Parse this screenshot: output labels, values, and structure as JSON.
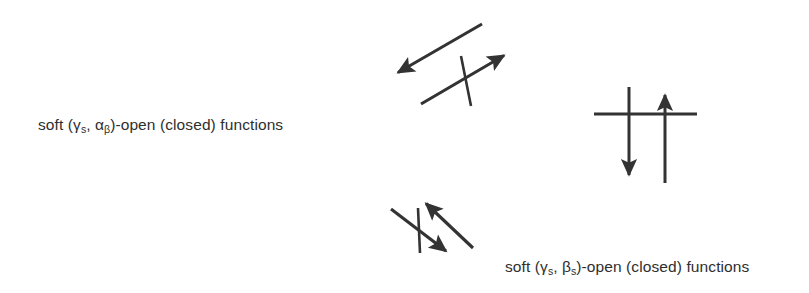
{
  "figure": {
    "width": 809,
    "height": 293,
    "background_color": "#ffffff",
    "ink_color": "#333333"
  },
  "labels": {
    "alpha_label": {
      "prefix": "soft (",
      "gamma": "γ",
      "gamma_sub": "s",
      "separator": ", ",
      "second_symbol": "α",
      "second_sub": "β",
      "suffix": ")-open (closed) functions",
      "full_text": "soft (γs, αβ)-open (closed) functions"
    },
    "beta_label": {
      "prefix": "soft (",
      "gamma": "γ",
      "gamma_sub": "s",
      "separator": ", ",
      "second_symbol": "β",
      "second_sub": "s",
      "suffix": ")-open (closed) functions",
      "full_text": "soft (γs, βs)-open (closed) functions"
    }
  },
  "diagram": {
    "type": "implication-diagram",
    "groups": [
      {
        "name": "upper-left-diagonal-pair",
        "orientation": "diagonal-up-right",
        "arrows": [
          {
            "name": "arrow-up-left",
            "x1": 482,
            "y1": 24,
            "x2": 392,
            "y2": 76,
            "head_at": "end",
            "direction": "up-left"
          },
          {
            "name": "arrow-up-right",
            "x1": 421,
            "y1": 104,
            "x2": 510,
            "y2": 51,
            "head_at": "end",
            "direction": "up-right"
          }
        ],
        "negation_stroke": {
          "x1": 461,
          "y1": 56,
          "x2": 471,
          "y2": 106
        }
      },
      {
        "name": "right-vertical-pair",
        "orientation": "vertical",
        "arrows": [
          {
            "name": "arrow-down",
            "x1": 629,
            "y1": 87,
            "x2": 629,
            "y2": 182,
            "head_at": "end",
            "direction": "down"
          },
          {
            "name": "arrow-up",
            "x1": 665,
            "y1": 183,
            "x2": 665,
            "y2": 87,
            "head_at": "end",
            "direction": "up"
          }
        ],
        "negation_stroke": {
          "x1": 594,
          "y1": 114,
          "x2": 697,
          "y2": 114
        }
      },
      {
        "name": "lower-left-diagonal-pair",
        "orientation": "diagonal-down-right",
        "arrows": [
          {
            "name": "arrow-up-left-lower",
            "x1": 473,
            "y1": 248,
            "x2": 420,
            "y2": 198,
            "head_at": "end",
            "direction": "up-left"
          },
          {
            "name": "arrow-down-right-lower",
            "x1": 391,
            "y1": 209,
            "x2": 452,
            "y2": 256,
            "head_at": "end",
            "direction": "down-right"
          }
        ],
        "negation_stroke": {
          "x1": 418,
          "y1": 208,
          "x2": 420,
          "y2": 253
        }
      }
    ]
  }
}
